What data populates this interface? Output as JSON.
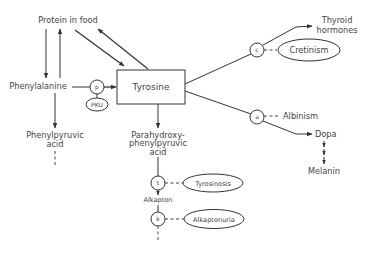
{
  "diagram": {
    "type": "metabolic-pathway",
    "nodes": {
      "protein_in_food": "Protein in food",
      "phenylalanine": "Phenylalanine",
      "tyrosine": "Tyrosine",
      "phenylpyruvic_acid": [
        "Phenylpyruvic",
        "acid"
      ],
      "parahydroxyphenylpyruvic_acid": [
        "Parahydroxy-",
        "phenylpyruvic",
        "acid"
      ],
      "alkapton": "Alkapton",
      "thyroid_hormones": [
        "Thyroid",
        "hormones"
      ],
      "dopa": "Dopa",
      "melanin": "Melanin"
    },
    "enzymes": {
      "p": "p",
      "t": "t",
      "k": "k",
      "c": "c",
      "a": "a"
    },
    "disorders": {
      "pku": "PKU",
      "tyrosinosis": "Tyrosinosis",
      "alkaptonuria": "Alkaptonuria",
      "cretinism": "Cretinism",
      "albinism": "Albinism"
    },
    "edges": [
      {
        "from": "Protein in food",
        "to": "Phenylalanine"
      },
      {
        "from": "Phenylalanine",
        "to": "Protein in food"
      },
      {
        "from": "Protein in food",
        "to": "Tyrosine"
      },
      {
        "from": "Tyrosine",
        "to": "Protein in food"
      },
      {
        "from": "Phenylalanine",
        "to": "Tyrosine",
        "enzyme": "p",
        "block": "PKU"
      },
      {
        "from": "Phenylalanine",
        "to": "Phenylpyruvic acid"
      },
      {
        "from": "Tyrosine",
        "to": "Parahydroxyphenylpyruvic acid"
      },
      {
        "from": "Parahydroxyphenylpyruvic acid",
        "to": "Alkapton",
        "enzyme": "t",
        "block": "Tyrosinosis"
      },
      {
        "from": "Alkapton",
        "to": "downstream",
        "enzyme": "k",
        "block": "Alkaptonuria"
      },
      {
        "from": "Tyrosine",
        "to": "Thyroid hormones",
        "enzyme": "c",
        "block": "Cretinism"
      },
      {
        "from": "Tyrosine",
        "to": "Dopa",
        "enzyme": "a",
        "block": "Albinism"
      },
      {
        "from": "Dopa",
        "to": "Melanin"
      }
    ]
  }
}
